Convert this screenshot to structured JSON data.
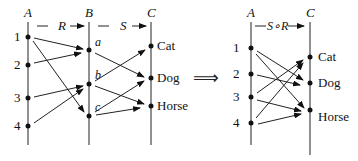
{
  "left": {
    "set_labels": {
      "A": "A",
      "B": "B",
      "C": "C"
    },
    "relation_labels": {
      "R": "R",
      "S": "S"
    },
    "A_nodes": [
      {
        "label": "1",
        "y": 37
      },
      {
        "label": "2",
        "y": 65
      },
      {
        "label": "3",
        "y": 98
      },
      {
        "label": "4",
        "y": 126
      }
    ],
    "B_nodes": [
      {
        "label": "a",
        "y": 50
      },
      {
        "label": "b",
        "y": 84
      },
      {
        "label": "c",
        "y": 116
      }
    ],
    "C_nodes": [
      {
        "label": "Cat",
        "y": 46
      },
      {
        "label": "Dog",
        "y": 78
      },
      {
        "label": "Horse",
        "y": 106
      }
    ],
    "R_edges": [
      [
        "1",
        "a"
      ],
      [
        "1",
        "c"
      ],
      [
        "2",
        "a"
      ],
      [
        "3",
        "b"
      ],
      [
        "4",
        "b"
      ]
    ],
    "S_edges": [
      [
        "a",
        "Dog"
      ],
      [
        "b",
        "Cat"
      ],
      [
        "b",
        "Horse"
      ],
      [
        "c",
        "Dog"
      ],
      [
        "c",
        "Horse"
      ]
    ]
  },
  "implies_symbol": "⟹",
  "right": {
    "set_labels": {
      "A": "A",
      "C": "C"
    },
    "relation_label": "S∘R",
    "A_nodes": [
      {
        "label": "1",
        "y": 48
      },
      {
        "label": "2",
        "y": 74
      },
      {
        "label": "3",
        "y": 97
      },
      {
        "label": "4",
        "y": 123
      }
    ],
    "C_nodes": [
      {
        "label": "Cat",
        "y": 57
      },
      {
        "label": "Dog",
        "y": 83
      },
      {
        "label": "Horse",
        "y": 110
      }
    ],
    "SR_edges": [
      [
        "1",
        "Dog"
      ],
      [
        "1",
        "Horse"
      ],
      [
        "2",
        "Dog"
      ],
      [
        "3",
        "Cat"
      ],
      [
        "3",
        "Horse"
      ],
      [
        "4",
        "Cat"
      ],
      [
        "4",
        "Horse"
      ]
    ]
  }
}
